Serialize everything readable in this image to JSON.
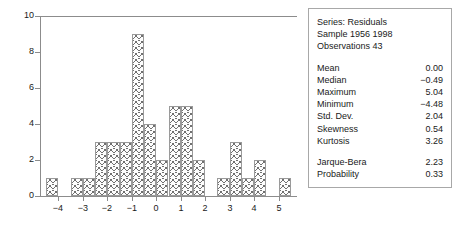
{
  "chart_data": {
    "type": "bar",
    "title": "",
    "xlabel": "",
    "ylabel": "",
    "grid": false,
    "legend": "none",
    "xlim": [
      -4.75,
      5.75
    ],
    "ylim": [
      0,
      10
    ],
    "xticks": [
      "−4",
      "−3",
      "−2",
      "−1",
      "0",
      "1",
      "2",
      "3",
      "4",
      "5"
    ],
    "xtick_values": [
      -4,
      -3,
      -2,
      -1,
      0,
      1,
      2,
      3,
      4,
      5
    ],
    "yticks": [
      "0",
      "2",
      "4",
      "6",
      "8",
      "10"
    ],
    "ytick_values": [
      0,
      2,
      4,
      6,
      8,
      10
    ],
    "bin_width": 0.5,
    "bin_starts": [
      -4.5,
      -3.5,
      -3.0,
      -2.5,
      -2.0,
      -1.5,
      -1.0,
      -0.5,
      0.0,
      0.5,
      1.0,
      1.5,
      2.5,
      3.0,
      3.5,
      4.0,
      5.0
    ],
    "categories": [
      "-4.5",
      "-3.5",
      "-3.0",
      "-2.5",
      "-2.0",
      "-1.5",
      "-1.0",
      "-0.5",
      "0.0",
      "0.5",
      "1.0",
      "1.5",
      "2.5",
      "3.0",
      "3.5",
      "4.0",
      "5.0"
    ],
    "values": [
      1,
      1,
      1,
      3,
      3,
      3,
      9,
      4,
      2,
      5,
      5,
      2,
      1,
      3,
      1,
      2,
      1
    ]
  },
  "stats_panel": {
    "header": [
      "Series: Residuals",
      "Sample 1956 1998",
      "Observations 43"
    ],
    "rows": [
      {
        "label": "Mean",
        "value": "0.00"
      },
      {
        "label": "Median",
        "value": "−0.49"
      },
      {
        "label": "Maximum",
        "value": "5.04"
      },
      {
        "label": "Minimum",
        "value": "−4.48"
      },
      {
        "label": "Std. Dev.",
        "value": "2.04"
      },
      {
        "label": "Skewness",
        "value": "0.54"
      },
      {
        "label": "Kurtosis",
        "value": "3.26"
      }
    ],
    "test_rows": [
      {
        "label": "Jarque-Bera",
        "value": "2.23"
      },
      {
        "label": "Probability",
        "value": "0.33"
      }
    ]
  },
  "colors": {
    "axis": "#8c8c8c",
    "bar_edge": "#9a9a9a",
    "bar_hatch": "#707070",
    "panel_border": "#a8a8a8",
    "text": "#1a1a1a",
    "background": "#ffffff"
  }
}
